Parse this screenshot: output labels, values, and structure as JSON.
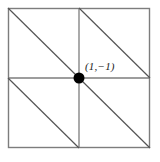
{
  "figure": {
    "type": "geometric-diagram",
    "background_color": "#ffffff",
    "line_color": "#7d7d7d",
    "diagonal_color": "#555555",
    "point_color": "#000000",
    "label_color": "#1a1a1a",
    "square": {
      "left": 8,
      "top": 8,
      "right": 150,
      "bottom": 148
    },
    "center_point": {
      "x": 79,
      "y": 78,
      "radius": 5.5
    },
    "grid_lines": [
      {
        "name": "vertical-midline",
        "x1": 79,
        "y1": 8,
        "x2": 79,
        "y2": 148
      },
      {
        "name": "horizontal-midline",
        "x1": 8,
        "y1": 78,
        "x2": 150,
        "y2": 78
      }
    ],
    "diagonals": [
      {
        "name": "diagonal-top-left",
        "x1": 8,
        "y1": 8,
        "x2": 79,
        "y2": 78
      },
      {
        "name": "diagonal-top-right",
        "x1": 79,
        "y1": 8,
        "x2": 150,
        "y2": 78
      },
      {
        "name": "diagonal-bottom-left",
        "x1": 8,
        "y1": 78,
        "x2": 79,
        "y2": 148
      },
      {
        "name": "diagonal-bottom-right",
        "x1": 79,
        "y1": 78,
        "x2": 150,
        "y2": 148
      }
    ],
    "labels": {
      "center_point_label": "(1,−1)"
    }
  }
}
